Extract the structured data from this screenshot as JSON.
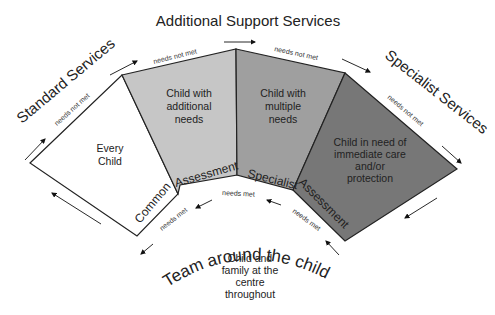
{
  "title": "Additional Support Services",
  "service_labels": {
    "standard": "Standard Services",
    "additional": "Additional Support Services",
    "specialist": "Specialist Services",
    "team": "Team around the child"
  },
  "segments": [
    {
      "id": "every-child",
      "lines": [
        "Every",
        "Child"
      ],
      "color": "#ffffff"
    },
    {
      "id": "additional-needs",
      "lines": [
        "Child with",
        "additional",
        "needs"
      ],
      "color": "#c6c6c6"
    },
    {
      "id": "multiple-needs",
      "lines": [
        "Child with",
        "multiple",
        "needs"
      ],
      "color": "#9f9f9f"
    },
    {
      "id": "immediate-care",
      "lines": [
        "Child in need of",
        "immediate care",
        "and/or",
        "protection"
      ],
      "color": "#777777"
    }
  ],
  "assessments": {
    "common_1": "Common",
    "common_2": "Assessment",
    "specialist_1": "Specialist",
    "specialist_2": "Assessment"
  },
  "flow_labels": {
    "not_met": "needs not met",
    "met": "needs met"
  },
  "centre": {
    "lines": [
      "Child and",
      "family at the",
      "centre",
      "throughout"
    ]
  }
}
